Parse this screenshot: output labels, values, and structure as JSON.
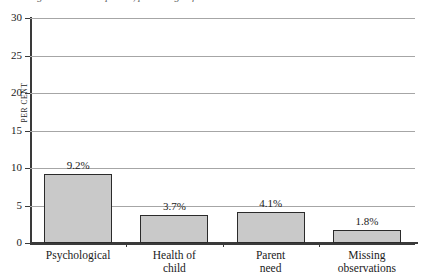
{
  "figure": {
    "title_fragment": "Figure: reasons reported, percentage of all cases",
    "background": "#ffffff"
  },
  "chart_data": {
    "type": "bar",
    "title": "",
    "xlabel": "",
    "ylabel": "Per cent",
    "categories": [
      "Psychological",
      "Health of child",
      "Parent need",
      "Missing observations"
    ],
    "category_lines": [
      [
        "Psychological"
      ],
      [
        "Health of",
        "child"
      ],
      [
        "Parent",
        "need"
      ],
      [
        "Missing",
        "observations"
      ]
    ],
    "values": [
      9.2,
      3.7,
      4.1,
      1.8
    ],
    "data_labels": [
      "9.2%",
      "3.7%",
      "4.1%",
      "1.8%"
    ],
    "ylim": [
      0,
      30
    ],
    "yticks": [
      0,
      5,
      10,
      15,
      20,
      25,
      30
    ],
    "ytick_labels": [
      "0",
      "5",
      "10",
      "15",
      "20",
      "25",
      "30"
    ],
    "grid": true,
    "legend": "none",
    "bar_fill_color": "#c9c9c9",
    "bar_edge_color": "#2b2b2b",
    "gridline_color": "#a6a6a6",
    "axis_color": "#3a3a3a"
  }
}
